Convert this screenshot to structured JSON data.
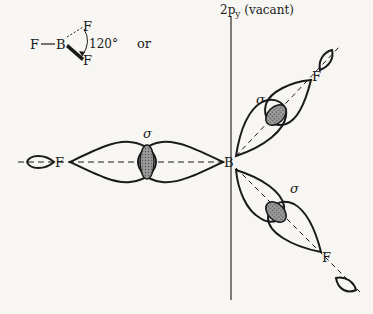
{
  "inset": {
    "atoms": [
      "F",
      "B",
      "F",
      "F"
    ],
    "angle_label": "120°",
    "or_label": "or"
  },
  "axis": {
    "label_prefix": "2p",
    "label_sub": "y",
    "label_suffix": " (vacant)"
  },
  "labels": {
    "sigma": "σ",
    "boron": "B",
    "fluorine": "F"
  },
  "colors": {
    "ink": "#1a1a1a",
    "overlap_fill": "#8a8a8a",
    "background": "#f7f6f3"
  }
}
